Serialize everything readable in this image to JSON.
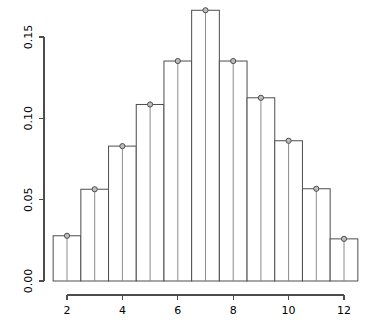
{
  "chart_data": {
    "type": "bar",
    "title": "",
    "subtitle": "",
    "xlabel": "",
    "ylabel": "",
    "categories": [
      "2",
      "3",
      "4",
      "5",
      "6",
      "7",
      "8",
      "9",
      "10",
      "11",
      "12"
    ],
    "x": [
      2,
      3,
      4,
      5,
      6,
      7,
      8,
      9,
      10,
      11,
      12
    ],
    "values": [
      0.0278,
      0.0564,
      0.0829,
      0.1085,
      0.1352,
      0.1664,
      0.1352,
      0.1126,
      0.0862,
      0.0567,
      0.0259
    ],
    "xlim": [
      1.5,
      12.5
    ],
    "ylim": [
      0.0,
      0.1664
    ],
    "xticks": [
      2,
      4,
      6,
      8,
      10,
      12
    ],
    "xtick_labels": [
      "2",
      "4",
      "6",
      "8",
      "10",
      "12"
    ],
    "yticks": [
      0.0,
      0.05,
      0.1,
      0.15
    ],
    "ytick_labels": [
      "0.00",
      "0.05",
      "0.10",
      "0.15"
    ],
    "grid": false,
    "legend": null,
    "bar_fill": "#ffffff",
    "bar_stroke": "#4d4d4d",
    "marker_fill": "#bdbdbd",
    "marker_stroke": "#4d4d4d",
    "stem_color": "#8c8c8c",
    "axis_color": "#4d4d4d",
    "background": "#ffffff",
    "marker_shape": "circle",
    "has_stems": true
  }
}
